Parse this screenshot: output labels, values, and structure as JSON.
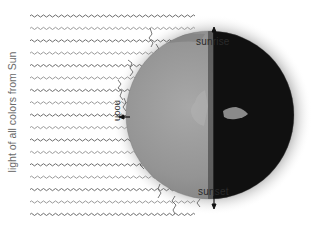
{
  "diagram": {
    "labels": {
      "incoming_light": "light of all colors from Sun",
      "sunrise": "sunrise",
      "noon": "noon",
      "sunset": "sunset"
    },
    "icons": {
      "earth": "earth-globe-icon",
      "light_waves": "wavy-light-ray-icon",
      "arrow": "arrow-icon"
    },
    "light_rays": {
      "count": 17,
      "start_x": 30,
      "first_y": 16,
      "spacing": 12.4
    },
    "earth": {
      "center_x": 210,
      "center_y": 115,
      "radius": 84,
      "terminator_x": 213
    },
    "colors": {
      "background": "#ffffff",
      "ray_dark": "#6e6e6e",
      "ray_light": "#9a9a9a",
      "day_side": "#8f8f8f",
      "night_side": "#101010",
      "atmosphere_glow": "#cfcfcf",
      "label_text": "#2a2a2a"
    }
  }
}
